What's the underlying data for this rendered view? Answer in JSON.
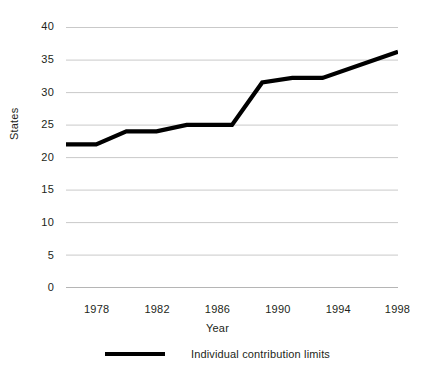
{
  "chart_data": {
    "type": "line",
    "title": "",
    "xlabel": "Year",
    "ylabel": "States",
    "xlim": [
      1976,
      1998
    ],
    "ylim": [
      0,
      40
    ],
    "grid": true,
    "legend_position": "bottom",
    "y_ticks": [
      0,
      5,
      10,
      15,
      20,
      25,
      30,
      35,
      40
    ],
    "y_tick_labels": [
      "0",
      "5",
      "10",
      "15",
      "20",
      "25",
      "30",
      "35",
      "40"
    ],
    "x_ticks": [
      1976,
      1978,
      1980,
      1982,
      1984,
      1986,
      1988,
      1990,
      1992,
      1994,
      1996,
      1998
    ],
    "x_tick_labels": [
      "1978",
      "1982",
      "1986",
      "1990",
      "1994",
      "1998"
    ],
    "x_labeled_ticks": [
      1978,
      1982,
      1986,
      1990,
      1994,
      1998
    ],
    "series": [
      {
        "name": "Individual contribution limits",
        "color": "#000000",
        "x": [
          1976,
          1978,
          1980,
          1982,
          1984,
          1987,
          1989,
          1991,
          1993,
          1998
        ],
        "values": [
          22,
          22,
          24,
          24,
          25,
          25,
          31.5,
          32.2,
          32.2,
          36.2
        ]
      }
    ]
  },
  "axes": {
    "y_title": "States",
    "x_title": "Year",
    "y_tick_labels": [
      "40",
      "35",
      "30",
      "25",
      "20",
      "15",
      "10",
      "5",
      "0"
    ],
    "x_tick_labels": [
      "1978",
      "1982",
      "1986",
      "1990",
      "1994",
      "1998"
    ]
  },
  "legend": {
    "entries": [
      {
        "label": "Individual contribution limits",
        "color": "#000000"
      }
    ]
  },
  "caption": {
    "text": ""
  },
  "colors": {
    "series": "#000000",
    "gridline": "#c9c9c9",
    "axis": "#b5b5b5",
    "text": "#231f20",
    "background": "#ffffff"
  }
}
